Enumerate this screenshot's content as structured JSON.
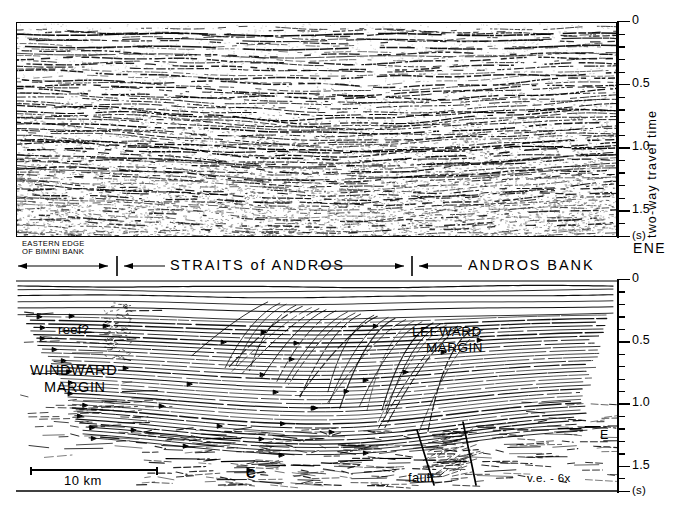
{
  "figure": {
    "kind": "seismic-reflection-profile",
    "orientation_label": "ENE",
    "vertical_exaggeration": "v.e. - 6x",
    "scale_bar": "10 km"
  },
  "axis": {
    "title": "two-way travel time",
    "unit_label": "(s)",
    "ticks": [
      "0",
      "0.5",
      "1.0",
      "1.5"
    ],
    "tick_values": [
      0,
      0.5,
      1.0,
      1.5
    ],
    "minor_step": 0.1,
    "range": [
      0,
      1.7
    ]
  },
  "sections": {
    "upper": {
      "name": "seismic-data-section",
      "top_time": 0,
      "bottom_time": 1.7
    },
    "lower": {
      "name": "line-drawing-interpretation",
      "top_time": 0,
      "bottom_time": 1.7
    }
  },
  "province_bar": {
    "left": {
      "label": "EASTERN EDGE\nOF BIMINI BANK",
      "line1": "EASTERN EDGE",
      "line2": "OF BIMINI BANK"
    },
    "center": {
      "label": "STRAITS of ANDROS"
    },
    "right": {
      "label": "ANDROS BANK"
    }
  },
  "annotations": [
    {
      "id": "windward-margin",
      "line1": "WINDWARD",
      "line2": "MARGIN"
    },
    {
      "id": "leeward-margin",
      "line1": "LEEWARD",
      "line2": "MARGIN"
    },
    {
      "id": "reef-query",
      "label": "reef?"
    },
    {
      "id": "horizon-c",
      "label": "C"
    },
    {
      "id": "fault",
      "label": "fault"
    },
    {
      "id": "horizon-e",
      "label": "E"
    }
  ],
  "labels": {
    "windward_1": "WINDWARD",
    "windward_2": "MARGIN",
    "leeward_1": "LEEWARD",
    "leeward_2": "MARGIN",
    "reef": "reef?",
    "c": "C",
    "fault": "fault",
    "e": "E",
    "ve": "v.e. - 6x",
    "km": "10 km",
    "ene": "ENE",
    "straits": "STRAITS of ANDROS",
    "andros_bank": "ANDROS BANK",
    "bimini_1": "EASTERN EDGE",
    "bimini_2": "OF BIMINI BANK",
    "t0": "0",
    "t05": "0.5",
    "t10": "1.0",
    "t15": "1.5",
    "tunit": "(s)",
    "axis_title": "two-way travel time"
  },
  "colors": {
    "ink": "#000000",
    "paper": "#ffffff"
  }
}
